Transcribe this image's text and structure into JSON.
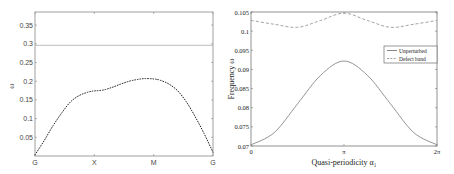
{
  "chart_data": [
    {
      "type": "scatter",
      "title": "",
      "xlabel": "",
      "ylabel": "ω",
      "xticks": [
        "G",
        "X",
        "M",
        "G"
      ],
      "yticks": [
        0.05,
        0.1,
        0.15,
        0.2,
        0.25,
        0.3,
        0.35
      ],
      "ytick_labels": [
        "0.05",
        "0.1",
        "0.15",
        "0.2",
        "0.25",
        "0.3",
        "0.35"
      ],
      "ylim": [
        0,
        0.385
      ],
      "grid": false,
      "series": [
        {
          "name": "dispersion band (dotted)",
          "style": "dotted",
          "x_path_fraction": [
            0.0,
            0.05,
            0.1,
            0.15,
            0.2,
            0.25,
            0.3,
            0.333,
            0.38,
            0.43,
            0.48,
            0.53,
            0.58,
            0.62,
            0.667,
            0.7,
            0.75,
            0.8,
            0.85,
            0.9,
            0.95,
            1.0
          ],
          "values": [
            0.003,
            0.04,
            0.08,
            0.115,
            0.145,
            0.162,
            0.171,
            0.174,
            0.176,
            0.183,
            0.192,
            0.2,
            0.205,
            0.207,
            0.206,
            0.203,
            0.193,
            0.175,
            0.145,
            0.105,
            0.06,
            0.01
          ]
        },
        {
          "name": "flat band",
          "style": "solid",
          "x_path_fraction": [
            0.0,
            1.0
          ],
          "values": [
            0.296,
            0.296
          ]
        }
      ]
    },
    {
      "type": "line",
      "title": "",
      "xlabel": "Quasi-periodicity α₁",
      "ylabel": "Frequency ω",
      "xticks": [
        "0",
        "π",
        "2π"
      ],
      "xlim": [
        0,
        6.2832
      ],
      "yticks": [
        0.07,
        0.075,
        0.08,
        0.085,
        0.09,
        0.095,
        0.1,
        0.105
      ],
      "ytick_labels": [
        "0.07",
        "0.075",
        "0.08",
        "0.085",
        "0.09",
        "0.095",
        "0.1",
        "0.105"
      ],
      "ylim": [
        0.07,
        0.105
      ],
      "grid": false,
      "legend_position": "upper right (inside, mid-height)",
      "series": [
        {
          "name": "Unperturbed",
          "style": "solid",
          "x": [
            0,
            0.785,
            1.571,
            2.356,
            3.1416,
            3.927,
            4.712,
            5.498,
            6.2832
          ],
          "values": [
            0.0703,
            0.0735,
            0.081,
            0.0885,
            0.0922,
            0.0885,
            0.081,
            0.0735,
            0.0703
          ]
        },
        {
          "name": "Defect band",
          "style": "dashed",
          "x": [
            0,
            0.785,
            1.571,
            2.356,
            3.1416,
            3.927,
            4.712,
            5.498,
            6.2832
          ],
          "values": [
            0.1028,
            0.1018,
            0.101,
            0.1028,
            0.1047,
            0.1028,
            0.101,
            0.1018,
            0.1028
          ]
        }
      ]
    }
  ],
  "left": {
    "ylabel": "ω",
    "xticks": [
      "G",
      "X",
      "M",
      "G"
    ],
    "yticks": [
      "0.05",
      "0.1",
      "0.15",
      "0.2",
      "0.25",
      "0.3",
      "0.35"
    ]
  },
  "right": {
    "ylabel": "Frequency ω",
    "xlabel": "Quasi-periodicity α₁",
    "xticks": [
      "0",
      "π",
      "2π"
    ],
    "yticks": [
      "0.07",
      "0.075",
      "0.08",
      "0.085",
      "0.09",
      "0.095",
      "0.1",
      "0.105"
    ],
    "legend": [
      "Unperturbed",
      "Defect band"
    ]
  }
}
